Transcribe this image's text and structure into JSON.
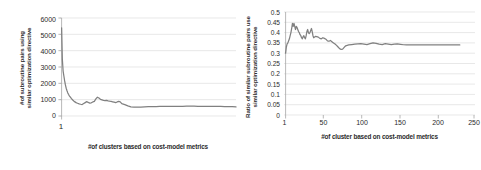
{
  "figure": {
    "background": "#ffffff",
    "series_color": "#808080",
    "grid_color": "#d9d9d9",
    "axis_color": "#a6a6a6",
    "text_color": "#2b2b2b"
  },
  "panels": {
    "left": {
      "ytitle_line1": "#of subroutine pairs using",
      "ytitle_line2": "similar optimization directive",
      "xtitle": "#of clusters based on cost-model metrics",
      "yticks": [
        "6000",
        "5000",
        "4000",
        "3000",
        "2000",
        "1000",
        "0"
      ],
      "xticks": [
        "1"
      ]
    },
    "right": {
      "ytitle_line1": "Ratio of similar subroutine pairs use",
      "ytitle_line2": "similar optimization directive",
      "xtitle": "#of cluster based on cost-model metrics",
      "yticks": [
        "0.5",
        "0.45",
        "0.4",
        "0.35",
        "0.3",
        "0.25",
        "0.2",
        "0.15",
        "0.1",
        "0.05",
        "0"
      ],
      "xticks": [
        "1",
        "50",
        "100",
        "150",
        "200",
        "250"
      ]
    }
  },
  "chart_data": [
    {
      "type": "line",
      "id": "left-chart",
      "title": "",
      "xlabel": "#of clusters based on cost-model metrics",
      "ylabel": "#of subroutine pairs using similar optimization directive",
      "ylim": [
        0,
        6000
      ],
      "yticks": [
        0,
        1000,
        2000,
        3000,
        4000,
        5000,
        6000
      ],
      "xlim": [
        1,
        230
      ],
      "xticks": [
        1
      ],
      "grid": true,
      "legend": "none",
      "x": [
        1,
        2,
        3,
        4,
        5,
        6,
        7,
        8,
        9,
        10,
        11,
        12,
        13,
        14,
        15,
        16,
        17,
        18,
        19,
        20,
        22,
        24,
        26,
        28,
        30,
        32,
        34,
        36,
        38,
        40,
        42,
        44,
        46,
        48,
        50,
        52,
        54,
        56,
        58,
        60,
        62,
        64,
        66,
        68,
        70,
        72,
        74,
        76,
        78,
        80,
        84,
        88,
        92,
        96,
        100,
        105,
        110,
        115,
        120,
        125,
        130,
        135,
        140,
        145,
        150,
        155,
        160,
        165,
        170,
        175,
        180,
        185,
        190,
        195,
        200,
        205,
        210,
        215,
        220,
        225,
        230
      ],
      "y": [
        5400,
        3450,
        2750,
        2450,
        2150,
        1900,
        1700,
        1560,
        1430,
        1330,
        1250,
        1180,
        1120,
        1060,
        1010,
        960,
        915,
        880,
        850,
        820,
        780,
        745,
        720,
        700,
        760,
        820,
        880,
        830,
        790,
        810,
        860,
        900,
        1050,
        1150,
        1100,
        1020,
        990,
        960,
        945,
        960,
        930,
        905,
        890,
        870,
        845,
        820,
        860,
        890,
        870,
        760,
        700,
        620,
        560,
        540,
        545,
        550,
        560,
        570,
        575,
        580,
        585,
        590,
        590,
        592,
        594,
        596,
        596,
        598,
        598,
        598,
        595,
        592,
        590,
        588,
        586,
        584,
        582,
        580,
        578,
        576,
        560
      ]
    },
    {
      "type": "line",
      "id": "right-chart",
      "title": "",
      "xlabel": "#of cluster based on cost-model metrics",
      "ylabel": "Ratio of similar subroutine pairs use similar optimization directive",
      "ylim": [
        0,
        0.5
      ],
      "yticks": [
        0,
        0.05,
        0.1,
        0.15,
        0.2,
        0.25,
        0.3,
        0.35,
        0.4,
        0.45,
        0.5
      ],
      "xlim": [
        1,
        250
      ],
      "xticks": [
        1,
        50,
        100,
        150,
        200,
        250
      ],
      "grid": true,
      "legend": "none",
      "x": [
        1,
        2,
        3,
        4,
        5,
        6,
        7,
        8,
        9,
        10,
        11,
        12,
        13,
        14,
        15,
        16,
        17,
        18,
        19,
        20,
        21,
        22,
        23,
        24,
        25,
        26,
        27,
        28,
        29,
        30,
        31,
        32,
        33,
        34,
        35,
        36,
        37,
        38,
        39,
        40,
        42,
        44,
        46,
        48,
        50,
        52,
        54,
        56,
        58,
        60,
        62,
        64,
        66,
        68,
        70,
        72,
        74,
        76,
        78,
        80,
        84,
        88,
        92,
        96,
        100,
        104,
        108,
        112,
        116,
        120,
        124,
        128,
        132,
        136,
        140,
        144,
        148,
        152,
        156,
        160,
        165,
        170,
        175,
        180,
        185,
        190,
        195,
        200,
        205,
        210,
        215,
        220,
        225,
        230
      ],
      "y": [
        0.3,
        0.33,
        0.345,
        0.35,
        0.36,
        0.37,
        0.385,
        0.4,
        0.42,
        0.445,
        0.43,
        0.445,
        0.43,
        0.415,
        0.43,
        0.425,
        0.415,
        0.405,
        0.4,
        0.39,
        0.385,
        0.375,
        0.37,
        0.38,
        0.385,
        0.375,
        0.37,
        0.385,
        0.405,
        0.415,
        0.4,
        0.395,
        0.4,
        0.41,
        0.42,
        0.405,
        0.385,
        0.375,
        0.378,
        0.382,
        0.38,
        0.378,
        0.372,
        0.37,
        0.375,
        0.372,
        0.368,
        0.36,
        0.358,
        0.362,
        0.355,
        0.35,
        0.345,
        0.338,
        0.33,
        0.322,
        0.318,
        0.32,
        0.328,
        0.336,
        0.34,
        0.342,
        0.344,
        0.345,
        0.346,
        0.344,
        0.342,
        0.346,
        0.35,
        0.348,
        0.344,
        0.342,
        0.346,
        0.344,
        0.342,
        0.344,
        0.345,
        0.343,
        0.341,
        0.34,
        0.34,
        0.34,
        0.34,
        0.34,
        0.34,
        0.34,
        0.34,
        0.34,
        0.34,
        0.34,
        0.34,
        0.34,
        0.34,
        0.34
      ]
    }
  ]
}
